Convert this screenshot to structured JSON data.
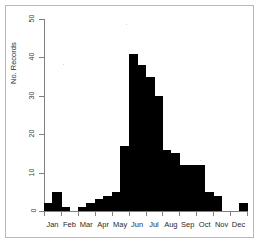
{
  "figure": {
    "background_color": "#ffffff",
    "frame_color": "#b9b9b9",
    "axis_color": "#808080",
    "bar_color": "#000000"
  },
  "axes": {
    "ylabel": "No. Records",
    "xlabel": "",
    "y_ticks": [
      {
        "value": 50,
        "label": "50"
      },
      {
        "value": 40,
        "label": "40"
      },
      {
        "value": 30,
        "label": "30"
      },
      {
        "value": 20,
        "label": "20"
      },
      {
        "value": 10,
        "label": "10"
      },
      {
        "value": 0,
        "label": "0"
      }
    ],
    "x_ticks": [
      {
        "label": "Jan"
      },
      {
        "label": "Feb"
      },
      {
        "label": "Mar"
      },
      {
        "label": "Apr"
      },
      {
        "label": "May"
      },
      {
        "label": "Jun"
      },
      {
        "label": "Jul"
      },
      {
        "label": "Aug"
      },
      {
        "label": "Sep"
      },
      {
        "label": "Oct"
      },
      {
        "label": "Nov"
      },
      {
        "label": "Dec"
      }
    ]
  },
  "chart_data": {
    "type": "bar",
    "title": "",
    "subtitle": "",
    "xlabel": "",
    "ylabel": "No. Records",
    "ylim": [
      0,
      50
    ],
    "grid": false,
    "legend": null,
    "note": "Histogram of records by half-month bin across the calendar year; 24 bins, strongly unimodal with a peak in mid-to-late May.",
    "bin_labels": [
      "Jan 1-15",
      "Jan 16-31",
      "Feb 1-14",
      "Feb 15-28",
      "Mar 1-15",
      "Mar 16-31",
      "Apr 1-15",
      "Apr 16-30",
      "May 1-15",
      "May 16-31",
      "Jun 1-15",
      "Jun 16-30",
      "Jul 1-15",
      "Jul 16-31",
      "Aug 1-15",
      "Aug 16-31",
      "Sep 1-15",
      "Sep 16-30",
      "Oct 1-15",
      "Oct 16-31",
      "Nov 1-15",
      "Nov 16-30",
      "Dec 1-15",
      "Dec 16-31"
    ],
    "categories": [
      "Jan 1-15",
      "Jan 16-31",
      "Feb 1-14",
      "Feb 15-28",
      "Mar 1-15",
      "Mar 16-31",
      "Apr 1-15",
      "Apr 16-30",
      "May 1-15",
      "May 16-31",
      "Jun 1-15",
      "Jun 16-30",
      "Jul 1-15",
      "Jul 16-31",
      "Aug 1-15",
      "Aug 16-31",
      "Sep 1-15",
      "Sep 16-30",
      "Oct 1-15",
      "Oct 16-31",
      "Nov 1-15",
      "Nov 16-30",
      "Dec 1-15",
      "Dec 16-31"
    ],
    "values": [
      2,
      5,
      1,
      0,
      1,
      2,
      3,
      4,
      5,
      17,
      41,
      38,
      35,
      30,
      16,
      15,
      12,
      12,
      12,
      5,
      4,
      0,
      0,
      2
    ],
    "monthly_totals": {
      "Jan": 7,
      "Feb": 1,
      "Mar": 3,
      "Apr": 7,
      "May": 22,
      "Jun": 79,
      "Jul": 65,
      "Aug": 31,
      "Sep": 24,
      "Oct": 17,
      "Nov": 4,
      "Dec": 2
    },
    "max_value": 41,
    "min_value": 0
  }
}
